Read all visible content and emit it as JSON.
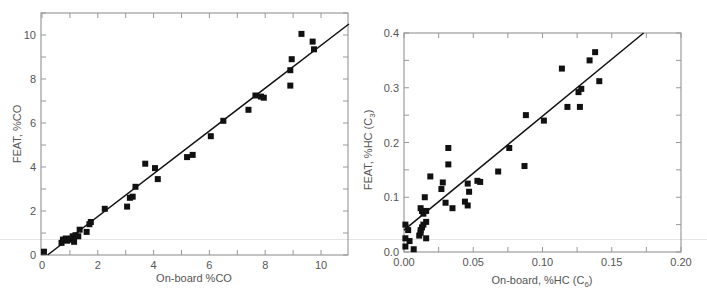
{
  "chart_data": [
    {
      "type": "scatter",
      "title": "",
      "xlabel": "On-board %CO",
      "ylabel": "FEAT, %CO",
      "xlim": [
        0,
        11
      ],
      "ylim": [
        0,
        11
      ],
      "x_ticks": [
        0,
        2,
        4,
        6,
        8,
        10
      ],
      "y_ticks": [
        0,
        2,
        4,
        6,
        8,
        10
      ],
      "x_minor_step": 1,
      "y_minor_step": 1,
      "grid": false,
      "legend": null,
      "fit_line": {
        "x": [
          0.2,
          11
        ],
        "y": [
          0,
          10.5
        ]
      },
      "points": [
        [
          0.07,
          0.15
        ],
        [
          0.7,
          0.55
        ],
        [
          0.75,
          0.7
        ],
        [
          0.85,
          0.75
        ],
        [
          0.9,
          0.65
        ],
        [
          0.95,
          0.72
        ],
        [
          1.0,
          0.7
        ],
        [
          1.05,
          0.75
        ],
        [
          1.1,
          0.85
        ],
        [
          1.15,
          0.6
        ],
        [
          1.2,
          0.9
        ],
        [
          1.3,
          0.85
        ],
        [
          1.35,
          1.15
        ],
        [
          1.6,
          1.05
        ],
        [
          1.7,
          1.4
        ],
        [
          1.75,
          1.5
        ],
        [
          2.25,
          2.1
        ],
        [
          3.05,
          2.2
        ],
        [
          3.15,
          2.6
        ],
        [
          3.25,
          2.65
        ],
        [
          3.35,
          3.1
        ],
        [
          3.7,
          4.15
        ],
        [
          4.05,
          3.95
        ],
        [
          4.15,
          3.45
        ],
        [
          5.2,
          4.45
        ],
        [
          5.4,
          4.55
        ],
        [
          6.05,
          5.4
        ],
        [
          6.5,
          6.1
        ],
        [
          7.4,
          6.6
        ],
        [
          7.65,
          7.25
        ],
        [
          7.85,
          7.2
        ],
        [
          7.95,
          7.15
        ],
        [
          8.9,
          7.7
        ],
        [
          8.9,
          8.4
        ],
        [
          8.95,
          8.9
        ],
        [
          9.3,
          10.05
        ],
        [
          9.7,
          9.7
        ],
        [
          9.75,
          9.35
        ]
      ]
    },
    {
      "type": "scatter",
      "title": "",
      "xlabel": "On-board, %HC (C",
      "xlabel_sub": "6",
      "xlabel_tail": ")",
      "ylabel": "FEAT, %HC (C",
      "ylabel_sub": "3",
      "ylabel_tail": ")",
      "xlim": [
        0,
        0.2
      ],
      "ylim": [
        0,
        0.4
      ],
      "x_ticks": [
        "0.00",
        "0.05",
        "0.10",
        "0.15",
        "0.20"
      ],
      "y_ticks": [
        "0.0",
        "0.1",
        "0.2",
        "0.3",
        "0.4"
      ],
      "x_minor_step": 0.025,
      "y_minor_step": 0.05,
      "grid": false,
      "legend": null,
      "fit_line": {
        "x": [
          0,
          0.173
        ],
        "y": [
          0.04,
          0.4
        ]
      },
      "points": [
        [
          0.001,
          0.05
        ],
        [
          0.001,
          0.025
        ],
        [
          0.001,
          0.01
        ],
        [
          0.003,
          0.04
        ],
        [
          0.004,
          0.02
        ],
        [
          0.007,
          0.005
        ],
        [
          0.011,
          0.03
        ],
        [
          0.012,
          0.035
        ],
        [
          0.012,
          0.04
        ],
        [
          0.013,
          0.045
        ],
        [
          0.012,
          0.08
        ],
        [
          0.013,
          0.075
        ],
        [
          0.014,
          0.07
        ],
        [
          0.014,
          0.05
        ],
        [
          0.015,
          0.1
        ],
        [
          0.016,
          0.075
        ],
        [
          0.016,
          0.055
        ],
        [
          0.016,
          0.025
        ],
        [
          0.019,
          0.138
        ],
        [
          0.027,
          0.115
        ],
        [
          0.028,
          0.127
        ],
        [
          0.03,
          0.09
        ],
        [
          0.032,
          0.16
        ],
        [
          0.032,
          0.19
        ],
        [
          0.035,
          0.08
        ],
        [
          0.044,
          0.092
        ],
        [
          0.046,
          0.125
        ],
        [
          0.046,
          0.085
        ],
        [
          0.047,
          0.11
        ],
        [
          0.053,
          0.13
        ],
        [
          0.055,
          0.128
        ],
        [
          0.068,
          0.147
        ],
        [
          0.076,
          0.19
        ],
        [
          0.087,
          0.157
        ],
        [
          0.088,
          0.25
        ],
        [
          0.101,
          0.24
        ],
        [
          0.114,
          0.335
        ],
        [
          0.118,
          0.265
        ],
        [
          0.126,
          0.292
        ],
        [
          0.127,
          0.265
        ],
        [
          0.128,
          0.298
        ],
        [
          0.134,
          0.35
        ],
        [
          0.138,
          0.365
        ],
        [
          0.141,
          0.312
        ]
      ]
    }
  ],
  "layout": {
    "left": {
      "frame": {
        "x0": 41,
        "y0": 13,
        "x1": 348,
        "y1": 255
      },
      "origin_px": [
        42,
        255
      ],
      "px_per_x": 27.9,
      "px_per_y": 22.0
    },
    "right": {
      "frame": {
        "x0": 49,
        "y0": 33,
        "x1": 326,
        "y1": 252
      },
      "origin_px": [
        49,
        252
      ],
      "px_per_x": 1385,
      "px_per_y": 547.5
    }
  },
  "colors": {
    "points": "#111111",
    "fit_line": "#111111",
    "axes": "#888888",
    "text": "#555555"
  }
}
